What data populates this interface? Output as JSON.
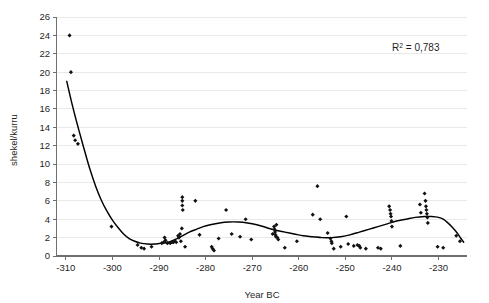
{
  "chart_data": {
    "type": "scatter",
    "title": "",
    "subtitle": "",
    "xlabel": "Year BC",
    "ylabel": "shekel/kurru",
    "xlim": [
      -312,
      -224
    ],
    "ylim": [
      0,
      26
    ],
    "grid": true,
    "legend": false,
    "x_ticks": [
      -310,
      -300,
      -290,
      -280,
      -270,
      -260,
      -250,
      -240,
      -230
    ],
    "x_tick_labels": [
      "-310",
      "-300",
      "-290",
      "-280",
      "-270",
      "-260",
      "-250",
      "-240",
      "-230"
    ],
    "y_ticks": [
      0,
      2,
      4,
      6,
      8,
      10,
      12,
      14,
      16,
      18,
      20,
      22,
      24,
      26
    ],
    "y_tick_labels": [
      "0",
      "2",
      "4",
      "6",
      "8",
      "10",
      "12",
      "14",
      "16",
      "18",
      "20",
      "22",
      "24",
      "26"
    ],
    "annotations": [
      {
        "name": "r-squared",
        "text": "R2 = 0,783",
        "display_prefix": "R",
        "display_sup": "2",
        "display_suffix": " = 0,783",
        "x": -238,
        "y": 23.2
      }
    ],
    "series": [
      {
        "name": "prices",
        "marker": "diamond",
        "color": "#111111",
        "points": [
          [
            -309.2,
            24.0
          ],
          [
            -308.9,
            20.0
          ],
          [
            -308.3,
            13.1
          ],
          [
            -308.0,
            12.6
          ],
          [
            -307.4,
            12.2
          ],
          [
            -300.2,
            3.2
          ],
          [
            -294.6,
            1.2
          ],
          [
            -293.8,
            0.9
          ],
          [
            -293.2,
            0.8
          ],
          [
            -291.6,
            1.0
          ],
          [
            -289.4,
            1.4
          ],
          [
            -289.0,
            1.5
          ],
          [
            -288.8,
            2.0
          ],
          [
            -288.6,
            1.7
          ],
          [
            -288.2,
            1.4
          ],
          [
            -287.6,
            1.4
          ],
          [
            -287.2,
            1.5
          ],
          [
            -286.9,
            1.5
          ],
          [
            -286.6,
            1.6
          ],
          [
            -286.3,
            1.5
          ],
          [
            -285.9,
            2.2
          ],
          [
            -285.7,
            2.0
          ],
          [
            -285.5,
            2.4
          ],
          [
            -285.3,
            1.6
          ],
          [
            -285.1,
            3.0
          ],
          [
            -285.0,
            6.4
          ],
          [
            -285.0,
            6.0
          ],
          [
            -285.0,
            5.5
          ],
          [
            -284.9,
            5.0
          ],
          [
            -284.4,
            1.0
          ],
          [
            -282.2,
            6.0
          ],
          [
            -281.3,
            2.3
          ],
          [
            -278.7,
            1.0
          ],
          [
            -278.5,
            0.8
          ],
          [
            -278.2,
            0.6
          ],
          [
            -277.2,
            1.9
          ],
          [
            -275.6,
            5.0
          ],
          [
            -274.4,
            2.4
          ],
          [
            -272.6,
            2.1
          ],
          [
            -271.4,
            4.0
          ],
          [
            -270.2,
            1.8
          ],
          [
            -265.6,
            2.4
          ],
          [
            -265.3,
            3.2
          ],
          [
            -265.2,
            2.9
          ],
          [
            -265.1,
            2.6
          ],
          [
            -265.0,
            2.3
          ],
          [
            -264.9,
            2.1
          ],
          [
            -264.8,
            3.4
          ],
          [
            -264.6,
            2.0
          ],
          [
            -264.4,
            1.8
          ],
          [
            -263.0,
            0.9
          ],
          [
            -260.4,
            1.6
          ],
          [
            -257.0,
            4.5
          ],
          [
            -256.0,
            7.6
          ],
          [
            -255.4,
            4.0
          ],
          [
            -253.8,
            2.5
          ],
          [
            -253.2,
            1.9
          ],
          [
            -253.0,
            1.6
          ],
          [
            -252.9,
            1.4
          ],
          [
            -252.5,
            0.8
          ],
          [
            -251.0,
            1.0
          ],
          [
            -249.8,
            4.3
          ],
          [
            -249.4,
            1.3
          ],
          [
            -248.2,
            1.1
          ],
          [
            -247.4,
            1.2
          ],
          [
            -247.0,
            1.1
          ],
          [
            -246.8,
            0.9
          ],
          [
            -245.6,
            0.8
          ],
          [
            -243.0,
            0.9
          ],
          [
            -242.4,
            0.8
          ],
          [
            -240.6,
            5.4
          ],
          [
            -240.4,
            5.0
          ],
          [
            -240.3,
            4.6
          ],
          [
            -240.2,
            4.3
          ],
          [
            -240.1,
            3.8
          ],
          [
            -240.0,
            3.2
          ],
          [
            -238.2,
            1.1
          ],
          [
            -234.0,
            5.6
          ],
          [
            -233.8,
            4.7
          ],
          [
            -233.0,
            6.8
          ],
          [
            -232.8,
            6.0
          ],
          [
            -232.7,
            5.4
          ],
          [
            -232.6,
            5.0
          ],
          [
            -232.5,
            4.6
          ],
          [
            -232.4,
            4.2
          ],
          [
            -232.3,
            3.6
          ],
          [
            -230.2,
            1.0
          ],
          [
            -229.0,
            0.9
          ],
          [
            -226.2,
            2.2
          ],
          [
            -225.4,
            1.6
          ]
        ]
      }
    ],
    "trendline": {
      "name": "polynomial-fit",
      "r_squared": "0,783",
      "color": "#000000",
      "points": [
        [
          -309.8,
          19.0
        ],
        [
          -308.5,
          16.2
        ],
        [
          -307.2,
          13.7
        ],
        [
          -306.0,
          11.5
        ],
        [
          -304.8,
          9.4
        ],
        [
          -303.6,
          7.6
        ],
        [
          -302.4,
          6.1
        ],
        [
          -301.2,
          4.9
        ],
        [
          -300.0,
          3.9
        ],
        [
          -298.8,
          3.1
        ],
        [
          -297.6,
          2.4
        ],
        [
          -296.4,
          1.9
        ],
        [
          -295.2,
          1.6
        ],
        [
          -294.0,
          1.4
        ],
        [
          -292.5,
          1.3
        ],
        [
          -291.0,
          1.3
        ],
        [
          -289.5,
          1.4
        ],
        [
          -288.0,
          1.5
        ],
        [
          -286.5,
          1.8
        ],
        [
          -285.0,
          2.2
        ],
        [
          -283.5,
          2.6
        ],
        [
          -282.0,
          2.9
        ],
        [
          -280.5,
          3.2
        ],
        [
          -279.0,
          3.4
        ],
        [
          -277.0,
          3.6
        ],
        [
          -275.0,
          3.7
        ],
        [
          -273.0,
          3.7
        ],
        [
          -271.0,
          3.6
        ],
        [
          -269.0,
          3.4
        ],
        [
          -267.0,
          3.1
        ],
        [
          -265.0,
          2.8
        ],
        [
          -263.0,
          2.6
        ],
        [
          -261.0,
          2.4
        ],
        [
          -259.0,
          2.2
        ],
        [
          -257.0,
          2.1
        ],
        [
          -255.0,
          2.0
        ],
        [
          -253.0,
          2.0
        ],
        [
          -251.0,
          2.1
        ],
        [
          -249.0,
          2.3
        ],
        [
          -247.0,
          2.6
        ],
        [
          -245.0,
          2.9
        ],
        [
          -243.0,
          3.2
        ],
        [
          -241.0,
          3.5
        ],
        [
          -239.0,
          3.8
        ],
        [
          -237.0,
          4.0
        ],
        [
          -235.0,
          4.2
        ],
        [
          -233.0,
          4.3
        ],
        [
          -231.5,
          4.3
        ],
        [
          -230.0,
          4.2
        ],
        [
          -229.0,
          4.0
        ],
        [
          -228.0,
          3.6
        ],
        [
          -227.0,
          3.1
        ],
        [
          -226.0,
          2.5
        ],
        [
          -225.2,
          1.9
        ],
        [
          -224.6,
          1.5
        ]
      ]
    }
  }
}
